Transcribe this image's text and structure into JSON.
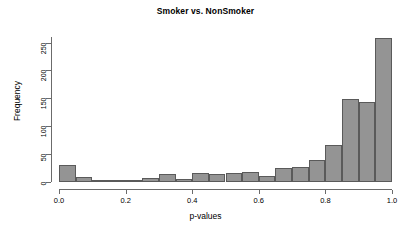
{
  "chart_data": {
    "type": "bar",
    "title": "Smoker vs. NonSmoker",
    "xlabel": "p-values",
    "ylabel": "Frequency",
    "xlim": [
      0.0,
      1.0
    ],
    "ylim": [
      0,
      260
    ],
    "grid": false,
    "legend": null,
    "bin_width": 0.05,
    "bar_fill_color": "#949494",
    "bar_border_color": "#5a5a5a",
    "x_tick_labels": [
      "0.0",
      "0.2",
      "0.4",
      "0.6",
      "0.8",
      "1.0"
    ],
    "x_tick_values": [
      0.0,
      0.2,
      0.4,
      0.6,
      0.8,
      1.0
    ],
    "y_tick_labels": [
      "0",
      "50",
      "100",
      "150",
      "200",
      "250"
    ],
    "y_tick_values": [
      0,
      50,
      100,
      150,
      200,
      250
    ],
    "categories": [
      "0.00-0.05",
      "0.05-0.10",
      "0.10-0.15",
      "0.15-0.20",
      "0.20-0.25",
      "0.25-0.30",
      "0.30-0.35",
      "0.35-0.40",
      "0.40-0.45",
      "0.45-0.50",
      "0.50-0.55",
      "0.55-0.60",
      "0.60-0.65",
      "0.65-0.70",
      "0.70-0.75",
      "0.75-0.80",
      "0.80-0.85",
      "0.85-0.90",
      "0.90-0.95",
      "0.95-1.00"
    ],
    "bin_starts": [
      0.0,
      0.05,
      0.1,
      0.15,
      0.2,
      0.25,
      0.3,
      0.35,
      0.4,
      0.45,
      0.5,
      0.55,
      0.6,
      0.65,
      0.7,
      0.75,
      0.8,
      0.85,
      0.9,
      0.95
    ],
    "values": [
      30,
      9,
      4,
      2,
      4,
      8,
      14,
      5,
      17,
      14,
      17,
      18,
      11,
      25,
      27,
      40,
      66,
      148,
      143,
      258
    ]
  }
}
